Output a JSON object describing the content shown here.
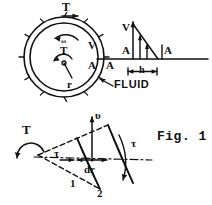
{
  "figure": {
    "caption": "Fig. 1",
    "upper_diagram": {
      "name": "rotating-cylinder-viscometer",
      "labels": {
        "torque_top": "T",
        "angular_velocity": "ω",
        "torque_center": "T",
        "radius": "r",
        "velocity_at_wall": "V",
        "area_at_wall": "A",
        "fluid": "FLUID"
      },
      "velocity_profile": {
        "velocity_label": "V",
        "area_label_left": "A",
        "area_label_right": "A",
        "baseline_label": "A",
        "gap_label": "h"
      }
    },
    "lower_diagram": {
      "name": "fluid-wedge-element",
      "labels": {
        "torque": "T",
        "velocity": "υ",
        "shear_left": "τ",
        "shear_right": "τ",
        "thickness": "dr",
        "surface_1": "1",
        "surface_2": "2"
      }
    }
  },
  "style": {
    "ink": "#111111"
  }
}
